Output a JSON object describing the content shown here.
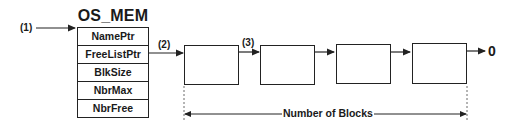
{
  "diagram": {
    "struct_title": "OS_MEM",
    "fields": [
      "NamePtr",
      "FreeListPtr",
      "BlkSize",
      "NbrMax",
      "NbrFree"
    ],
    "labels": {
      "entry": "(1)",
      "freelist_link": "(2)",
      "block_link": "(3)"
    },
    "block_count": 4,
    "terminator": "0",
    "span_label": "Number of Blocks",
    "colors": {
      "stroke": "#222222",
      "background": "#ffffff"
    }
  }
}
